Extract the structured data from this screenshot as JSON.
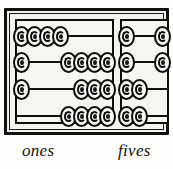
{
  "figure": {
    "name": "two-column-abacus",
    "background_color": "#fdfdfb",
    "frame_color": "#101010",
    "panel_fill": "#f6f5f0",
    "bead_fill": "#faf9f5",
    "bead_outline": "#0c0c0c"
  },
  "labels": {
    "ones": "ones",
    "fives": "fives"
  },
  "columns": [
    {
      "id": "ones",
      "label": "ones",
      "place_value": 1,
      "rods": [
        {
          "index": 0,
          "left_beads": 4,
          "right_beads": 0
        },
        {
          "index": 1,
          "left_beads": 1,
          "right_beads": 4
        },
        {
          "index": 2,
          "left_beads": 1,
          "right_beads": 3
        },
        {
          "index": 3,
          "left_beads": 0,
          "right_beads": 4
        }
      ]
    },
    {
      "id": "fives",
      "label": "fives",
      "place_value": 5,
      "rods": [
        {
          "index": 0,
          "left_beads": 1,
          "right_beads": 1
        },
        {
          "index": 1,
          "left_beads": 1,
          "right_beads": 1
        },
        {
          "index": 2,
          "left_beads": 2,
          "right_beads": 0
        },
        {
          "index": 3,
          "left_beads": 2,
          "right_beads": 0
        }
      ]
    }
  ]
}
